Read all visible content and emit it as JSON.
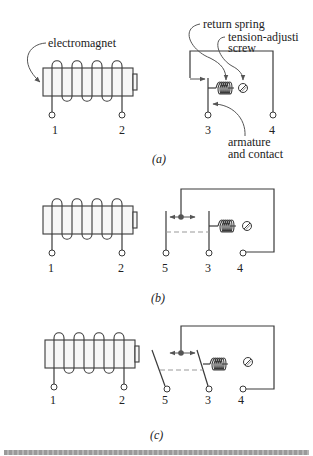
{
  "diagram": {
    "panels": [
      {
        "caption": "(a)",
        "labels": {
          "electromagnet": "electromagnet",
          "return_spring": "return spring",
          "tension_screw_line1": "tension-adjusti",
          "tension_screw_line2": "screw",
          "armature_line1": "armature",
          "armature_line2": "and contact"
        },
        "terminals": [
          "1",
          "2",
          "3",
          "4"
        ]
      },
      {
        "caption": "(b)",
        "terminals": [
          "1",
          "2",
          "5",
          "3",
          "4"
        ]
      },
      {
        "caption": "(c)",
        "terminals": [
          "1",
          "2",
          "5",
          "3",
          "4"
        ]
      }
    ]
  }
}
